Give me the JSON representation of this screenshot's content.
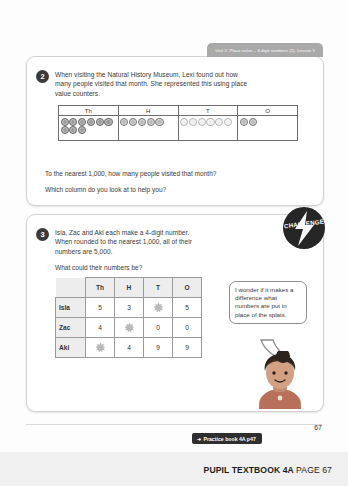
{
  "unit_tab": {
    "label": "Unit 2: Place value – 4-digit numbers (2), Lesson 5"
  },
  "question2": {
    "number": "2",
    "text_line1": "When visiting the Natural History Museum, Lexi found out how",
    "text_line2": "many people visited that month. She represented this using place",
    "text_line3": "value counters.",
    "followup1": "To the nearest 1,000, how many people visited that month?",
    "followup2": "Which column do you look at to help you?",
    "place_value_table": {
      "headers": [
        "Th",
        "H",
        "T",
        "O"
      ],
      "counts": [
        9,
        5,
        6,
        2
      ],
      "styles": [
        "dark",
        "mid",
        "light",
        "mid"
      ]
    }
  },
  "question3": {
    "number": "3",
    "text_line1": "Isla, Zac and Aki each make a 4-digit number.",
    "text_line2": "When rounded to the nearest 1,000, all of their",
    "text_line3": "numbers are 5,000.",
    "prompt": "What could their numbers be?",
    "badge_label": "CHALLENGE",
    "answer_table": {
      "corner": "",
      "headers": [
        "Th",
        "H",
        "T",
        "O"
      ],
      "rows": [
        {
          "name": "Isla",
          "values": [
            "5",
            "3",
            "splat",
            "5"
          ]
        },
        {
          "name": "Zac",
          "values": [
            "4",
            "splat",
            "0",
            "0"
          ]
        },
        {
          "name": "Aki",
          "values": [
            "splat",
            "4",
            "9",
            "9"
          ]
        }
      ]
    },
    "speech_bubble": "I wonder if it makes a difference what numbers are put in place of the splats."
  },
  "footer": {
    "practice_tab": "Practice book 4A p47",
    "page_number": "67",
    "label_bold": "PUPIL TEXTBOOK 4A",
    "label_page": "PAGE 67"
  },
  "colors": {
    "badge": "#262626",
    "unit_tab": "#a9a9a9",
    "footer_band": "#f0f0f0"
  }
}
